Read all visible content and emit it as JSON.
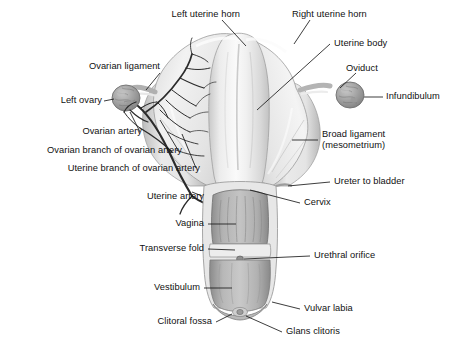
{
  "figure": {
    "kind": "anatomical-illustration",
    "background_color": "#ffffff",
    "label_color": "#111111",
    "leader_color": "#1a1a1a"
  },
  "labels": {
    "left_uterine_horn": "Left uterine horn",
    "right_uterine_horn": "Right uterine horn",
    "uterine_body": "Uterine body",
    "ovarian_ligament": "Ovarian ligament",
    "oviduct": "Oviduct",
    "infundibulum": "Infundibulum",
    "left_ovary": "Left ovary",
    "ovarian_artery": "Ovarian artery",
    "ovarian_branch": "Ovarian branch of ovarian artery",
    "uterine_branch": "Uterine branch of ovarian artery",
    "uterine_artery": "Uterine artery",
    "broad_ligament_1": "Broad ligament",
    "broad_ligament_2": "(mesometrium)",
    "ureter_to_bladder": "Ureter to bladder",
    "cervix": "Cervix",
    "vagina": "Vagina",
    "transverse_fold": "Transverse fold",
    "urethral_orifice": "Urethral orifice",
    "vestibulum": "Vestibulum",
    "vulvar_labia": "Vulvar labia",
    "clitoral_fossa": "Clitoral fossa",
    "glans_clitoris": "Glans clitoris"
  }
}
